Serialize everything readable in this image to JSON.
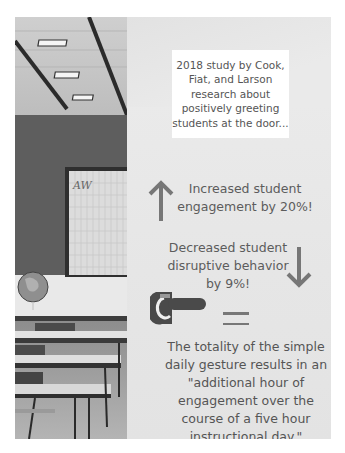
{
  "infographic": {
    "study_intro": "2018 study by Cook, Fiat, and Larson research about positively greeting students at the door...",
    "stat_increase": {
      "text": "Increased student engagement by 20%!",
      "icon": "arrow-up-icon",
      "value_percent": 20
    },
    "stat_decrease": {
      "text": "Decreased student disruptive behavior by 9%!",
      "icon": "arrow-down-icon",
      "value_percent": 9
    },
    "clock_icon": "clock-hand-icon",
    "equals_icon": "equals-icon",
    "conclusion": "The totality of the simple daily gesture results in an \"additional hour of engagement over the course of a five hour instructional day.\"",
    "photo": {
      "subject": "classroom",
      "board_logo": "AW"
    }
  },
  "colors": {
    "card_background": "#e9e9e9",
    "text": "#5c5c5c",
    "icon_gray": "#777777",
    "text_box": "#ffffff"
  }
}
